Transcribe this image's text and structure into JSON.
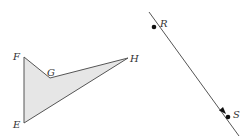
{
  "diagram": {
    "polygon": {
      "name": "quadrilateral EFGH",
      "vertices": [
        {
          "label": "F"
        },
        {
          "label": "G"
        },
        {
          "label": "H"
        },
        {
          "label": "E"
        }
      ],
      "fill_color": "#e6e6e6",
      "stroke_color": "#555555"
    },
    "segment": {
      "name": "line through R and S",
      "points": [
        {
          "label": "R"
        },
        {
          "label": "S"
        }
      ],
      "arrow": "toward S",
      "stroke_color": "#555555",
      "point_color": "#111111"
    }
  }
}
